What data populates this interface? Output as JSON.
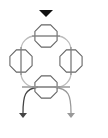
{
  "diagram": {
    "title": "",
    "colors": {
      "background": "#ffffff",
      "input_arrow": "#111111",
      "loop": "#bbbbbb",
      "octagon_stroke": "#666666",
      "octagon_line": "#888888",
      "bottom_line": "#999999",
      "output_left": "#444444",
      "output_right": "#999999"
    },
    "input": {
      "shape": "triangle-down",
      "x": 46,
      "y": 13
    },
    "loop": {
      "shape": "rounded-rect",
      "x1": 21,
      "y1": 36,
      "x2": 71,
      "y2": 87,
      "radius": 14
    },
    "nodes": [
      {
        "id": "top",
        "shape": "octagon",
        "cx": 46,
        "cy": 36,
        "r": 12,
        "line": "horizontal"
      },
      {
        "id": "left",
        "shape": "octagon",
        "cx": 21,
        "cy": 61,
        "r": 12,
        "line": "vertical"
      },
      {
        "id": "right",
        "shape": "octagon",
        "cx": 71,
        "cy": 61,
        "r": 12,
        "line": "vertical"
      },
      {
        "id": "bottom",
        "shape": "octagon",
        "cx": 46,
        "cy": 87,
        "r": 12,
        "line": "horizontal"
      }
    ],
    "outputs": [
      {
        "id": "left",
        "end_x": 23,
        "end_y": 117,
        "color_key": "output_left"
      },
      {
        "id": "right",
        "end_x": 71,
        "end_y": 117,
        "color_key": "output_right"
      }
    ]
  }
}
